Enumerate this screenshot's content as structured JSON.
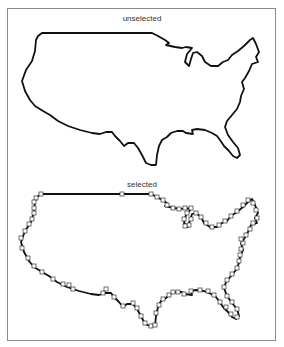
{
  "figure": {
    "panels": [
      {
        "label": "unselected",
        "state": "unselected",
        "show_handles": false
      },
      {
        "label": "selected",
        "state": "selected",
        "show_handles": true
      }
    ],
    "shape": "united-states-outline",
    "stroke_color": "#111111",
    "handle_fill": "#ffffff",
    "handle_stroke": "#333333",
    "frame_color": "#8a8a8a"
  }
}
